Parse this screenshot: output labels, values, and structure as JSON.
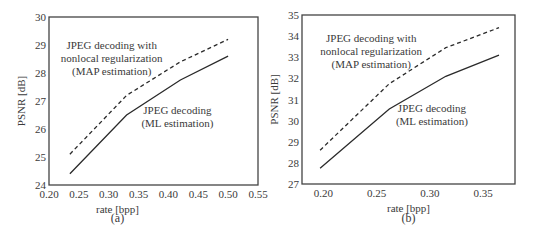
{
  "chart_data": [
    {
      "panel_label": "(a)",
      "type": "line",
      "title": "",
      "xlabel": "rate [bpp]",
      "ylabel": "PSNR [dB]",
      "xlim": [
        0.2,
        0.55
      ],
      "ylim": [
        24,
        30
      ],
      "xticks": [
        "0.20",
        "0.25",
        "0.30",
        "0.35",
        "0.40",
        "0.45",
        "0.50",
        "0.55"
      ],
      "yticks": [
        "24",
        "25",
        "26",
        "27",
        "28",
        "29",
        "30"
      ],
      "grid": false,
      "series": [
        {
          "name": "JPEG decoding with nonlocal regularization (MAP estimation)",
          "style": "dashed",
          "x": [
            0.235,
            0.33,
            0.42,
            0.5
          ],
          "y": [
            25.1,
            27.2,
            28.4,
            29.2
          ]
        },
        {
          "name": "JPEG decoding (ML estimation)",
          "style": "solid",
          "x": [
            0.235,
            0.33,
            0.42,
            0.5
          ],
          "y": [
            24.4,
            26.5,
            27.75,
            28.6
          ]
        }
      ],
      "annotations": [
        {
          "lines": [
            "JPEG decoding with",
            "nonlocal regularization",
            "(MAP estimation)"
          ],
          "x": 0.305,
          "y": 28.85
        },
        {
          "lines": [
            "JPEG decoding",
            "(ML estimation)"
          ],
          "x": 0.415,
          "y": 26.55
        }
      ]
    },
    {
      "panel_label": "(b)",
      "type": "line",
      "title": "",
      "xlabel": "rate [bpp]",
      "ylabel": "PSNR [dB]",
      "xlim": [
        0.18,
        0.38
      ],
      "ylim": [
        27,
        35
      ],
      "xticks": [
        "0.20",
        "0.25",
        "0.30",
        "0.35"
      ],
      "yticks": [
        "27",
        "28",
        "29",
        "30",
        "31",
        "32",
        "33",
        "34",
        "35"
      ],
      "grid": false,
      "series": [
        {
          "name": "JPEG decoding with nonlocal regularization (MAP estimation)",
          "style": "dashed",
          "x": [
            0.197,
            0.262,
            0.315,
            0.365
          ],
          "y": [
            28.6,
            31.75,
            33.45,
            34.4
          ]
        },
        {
          "name": "JPEG decoding (ML estimation)",
          "style": "solid",
          "x": [
            0.197,
            0.262,
            0.315,
            0.365
          ],
          "y": [
            27.75,
            30.55,
            32.1,
            33.1
          ]
        }
      ],
      "annotations": [
        {
          "lines": [
            "JPEG decoding with",
            "nonlocal regularization",
            "(MAP estimation)"
          ],
          "x": 0.245,
          "y": 33.7
        },
        {
          "lines": [
            "JPEG decoding",
            "(ML estimation)"
          ],
          "x": 0.302,
          "y": 30.4
        }
      ]
    }
  ],
  "layout": {
    "panels": [
      {
        "frame": {
          "x0": 49,
          "y0": 17,
          "x1": 258,
          "y1": 185
        },
        "label_y": 230
      },
      {
        "frame": {
          "x0": 302,
          "y0": 15,
          "x1": 515,
          "y1": 184
        },
        "label_y": 230
      }
    ]
  }
}
